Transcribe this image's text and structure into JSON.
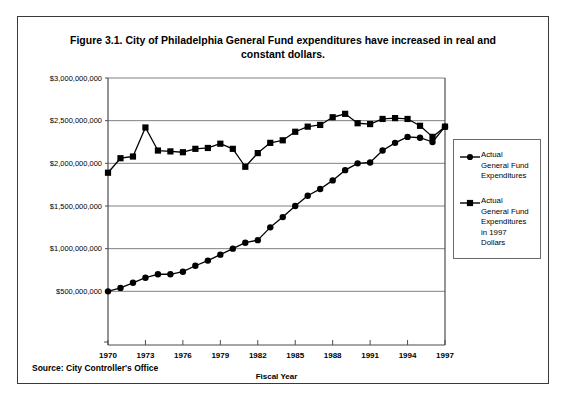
{
  "figure": {
    "title": "Figure 3.1. City of Philadelphia General Fund expenditures have increased in real and constant dollars.",
    "source": "Source: City Controller's Office"
  },
  "chart_data": {
    "type": "line",
    "title": "Figure 3.1. City of Philadelphia General Fund expenditures have increased in real and constant dollars.",
    "xlabel": "Fiscal Year",
    "ylabel": "",
    "xlim": [
      1970,
      1997
    ],
    "ylim": [
      0,
      3000000000
    ],
    "grid": true,
    "legend_position": "right",
    "ytick_labels": [
      "$500,000,000",
      "$1,000,000,000",
      "$1,500,000,000",
      "$2,000,000,000",
      "$2,500,000,000",
      "$3,000,000,000"
    ],
    "ytick_values": [
      500000000,
      1000000000,
      1500000000,
      2000000000,
      2500000000,
      3000000000
    ],
    "xtick_labels": [
      "1970",
      "1973",
      "1976",
      "1979",
      "1982",
      "1985",
      "1988",
      "1991",
      "1994",
      "1997"
    ],
    "xtick_values": [
      1970,
      1973,
      1976,
      1979,
      1982,
      1985,
      1988,
      1991,
      1994,
      1997
    ],
    "x": [
      1970,
      1971,
      1972,
      1973,
      1974,
      1975,
      1976,
      1977,
      1978,
      1979,
      1980,
      1981,
      1982,
      1983,
      1984,
      1985,
      1986,
      1987,
      1988,
      1989,
      1990,
      1991,
      1992,
      1993,
      1994,
      1995,
      1996,
      1997
    ],
    "series": [
      {
        "name": "Actual General Fund Expenditures",
        "marker": "circle",
        "values": [
          500000000,
          540000000,
          600000000,
          660000000,
          700000000,
          700000000,
          730000000,
          800000000,
          860000000,
          930000000,
          1000000000,
          1070000000,
          1100000000,
          1250000000,
          1370000000,
          1500000000,
          1620000000,
          1700000000,
          1800000000,
          1920000000,
          2000000000,
          2010000000,
          2150000000,
          2240000000,
          2310000000,
          2300000000,
          2250000000,
          2430000000
        ]
      },
      {
        "name": "Actual General Fund Expenditures in 1997 Dollars",
        "marker": "square",
        "values": [
          1890000000,
          2060000000,
          2080000000,
          2420000000,
          2150000000,
          2140000000,
          2130000000,
          2170000000,
          2180000000,
          2230000000,
          2170000000,
          1960000000,
          2120000000,
          2240000000,
          2270000000,
          2370000000,
          2430000000,
          2450000000,
          2540000000,
          2580000000,
          2470000000,
          2460000000,
          2520000000,
          2530000000,
          2520000000,
          2440000000,
          2310000000,
          2430000000
        ]
      }
    ]
  },
  "legend": {
    "entries": [
      {
        "label": "Actual\nGeneral Fund\nExpenditures",
        "marker": "circle"
      },
      {
        "label": "Actual\nGeneral Fund\nExpenditures\nin 1997\nDollars",
        "marker": "square"
      }
    ]
  },
  "colors": {
    "series_line": "#000000",
    "grid": "#808080",
    "axis": "#4d4d4d",
    "frame": "#3a3a3a",
    "background": "#ffffff"
  }
}
